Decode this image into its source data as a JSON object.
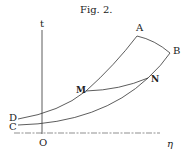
{
  "figure": {
    "caption": "Fig. 2.",
    "axes": {
      "vertical_label": "t",
      "horizontal_label": "η",
      "origin_label": "O"
    },
    "points": {
      "A": "A",
      "B": "B",
      "M": "M",
      "N": "N",
      "C": "C",
      "D": "D"
    },
    "stroke_color": "#333333"
  }
}
